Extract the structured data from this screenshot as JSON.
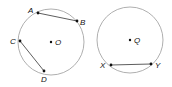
{
  "diagram": {
    "left_circle": {
      "center": {
        "label": "O",
        "x": 51,
        "y": 42
      },
      "radius": 33,
      "points": [
        {
          "label": "A",
          "x": 38,
          "y": 13
        },
        {
          "label": "B",
          "x": 77,
          "y": 21
        },
        {
          "label": "C",
          "x": 20,
          "y": 41
        },
        {
          "label": "D",
          "x": 44,
          "y": 71
        }
      ],
      "chords": [
        [
          "A",
          "B"
        ],
        [
          "C",
          "D"
        ]
      ]
    },
    "right_circle": {
      "center": {
        "label": "Q",
        "x": 130,
        "y": 40
      },
      "radius": 33,
      "points": [
        {
          "label": "X",
          "x": 111,
          "y": 65
        },
        {
          "label": "Y",
          "x": 151,
          "y": 64
        }
      ],
      "chords": [
        [
          "X",
          "Y"
        ]
      ]
    },
    "colors": {
      "circle": "#9a9a9a",
      "chord": "#333333",
      "point": "#111111"
    }
  }
}
